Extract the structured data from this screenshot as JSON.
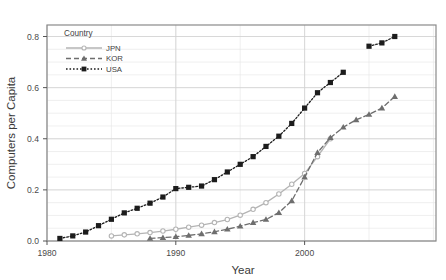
{
  "chart_data": {
    "type": "line",
    "title": "",
    "xlabel": "Year",
    "ylabel": "Computers per Capita",
    "xlim": [
      1980,
      2010.2
    ],
    "ylim": [
      0.0,
      0.845
    ],
    "xticks": [
      1980,
      1990,
      2000
    ],
    "xtick_labels": [
      "1980",
      "1990",
      "2000"
    ],
    "yticks": [
      0.0,
      0.2,
      0.4,
      0.6,
      0.8
    ],
    "ytick_labels": [
      "0.0",
      "0.2",
      "0.4",
      "0.6",
      "0.8"
    ],
    "grid": true,
    "grid_minor_step": 0.05,
    "grid_minor_x_step": 5,
    "legend_title": "Country",
    "legend_position": "top-left-inside",
    "series": [
      {
        "name": "JPN",
        "color": "#b4b4b4",
        "marker": "circle",
        "linestyle": "solid",
        "x": [
          1985,
          1986,
          1987,
          1988,
          1989,
          1990,
          1991,
          1992,
          1993,
          1994,
          1995,
          1996,
          1997,
          1998,
          1999,
          2000,
          2001,
          2002
        ],
        "y": [
          0.02,
          0.024,
          0.028,
          0.033,
          0.039,
          0.046,
          0.054,
          0.062,
          0.072,
          0.084,
          0.101,
          0.124,
          0.15,
          0.184,
          0.222,
          0.264,
          0.33,
          0.4
        ]
      },
      {
        "name": "KOR",
        "color": "#6e6e6e",
        "marker": "triangle",
        "linestyle": "dashed",
        "x": [
          1988,
          1989,
          1990,
          1991,
          1992,
          1993,
          1994,
          1995,
          1996,
          1997,
          1998,
          1999,
          2000,
          2001,
          2002,
          2003,
          2004,
          2005,
          2006,
          2007
        ],
        "y": [
          0.01,
          0.013,
          0.017,
          0.022,
          0.028,
          0.036,
          0.046,
          0.058,
          0.072,
          0.084,
          0.111,
          0.157,
          0.25,
          0.346,
          0.404,
          0.445,
          0.474,
          0.495,
          0.52,
          0.565
        ]
      },
      {
        "name": "USA",
        "color": "#1c1c1c",
        "marker": "square",
        "linestyle": "dotted",
        "x": [
          1981,
          1982,
          1983,
          1984,
          1985,
          1986,
          1987,
          1988,
          1989,
          1990,
          1991,
          1992,
          1993,
          1994,
          1995,
          1996,
          1997,
          1998,
          1999,
          2000,
          2001,
          2002,
          2003,
          2005,
          2006,
          2007
        ],
        "y": [
          0.01,
          0.02,
          0.035,
          0.06,
          0.085,
          0.11,
          0.128,
          0.148,
          0.172,
          0.205,
          0.21,
          0.215,
          0.24,
          0.27,
          0.3,
          0.33,
          0.37,
          0.41,
          0.46,
          0.52,
          0.58,
          0.62,
          0.66,
          0.762,
          0.775,
          0.8
        ]
      }
    ]
  },
  "legend": {
    "title": "Country",
    "entries": [
      {
        "label": "JPN"
      },
      {
        "label": "KOR"
      },
      {
        "label": "USA"
      }
    ]
  },
  "axes": {
    "x_title": "Year",
    "y_title": "Computers per Capita"
  },
  "colors": {
    "jpn": "#b4b4b4",
    "kor": "#6e6e6e",
    "usa": "#1c1c1c",
    "grid": "#e4e4e4",
    "frame": "#8a8a8a",
    "background": "#ffffff"
  }
}
